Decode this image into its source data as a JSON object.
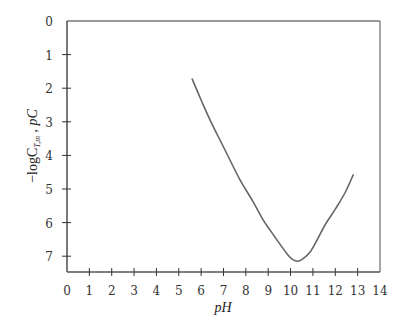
{
  "chart_data": {
    "type": "line",
    "title": "",
    "xlabel": "pH",
    "ylabel": "−logC_T,m , pC",
    "ylabel_parts": {
      "prefix": "−logC",
      "subscript": "T,m",
      "suffix": " ,  pC"
    },
    "xlim": [
      0,
      14
    ],
    "ylim": [
      0,
      7.5
    ],
    "y_inverted": true,
    "grid": false,
    "x_ticks": [
      "0",
      "1",
      "2",
      "3",
      "4",
      "5",
      "6",
      "7",
      "8",
      "9",
      "10",
      "11",
      "12",
      "13",
      "14"
    ],
    "y_ticks": [
      "0",
      "1",
      "2",
      "3",
      "4",
      "5",
      "6",
      "7"
    ],
    "series": [
      {
        "name": "log C_T,m vs pH",
        "color": "#666666",
        "x": [
          5.6,
          6.0,
          6.4,
          7.0,
          7.74,
          8.3,
          8.77,
          9.08,
          9.5,
          9.88,
          10.1,
          10.3,
          10.5,
          10.87,
          11.2,
          11.54,
          12.0,
          12.43,
          12.8
        ],
        "y": [
          1.73,
          2.35,
          2.95,
          3.75,
          4.73,
          5.35,
          5.92,
          6.22,
          6.62,
          6.96,
          7.1,
          7.15,
          7.1,
          6.88,
          6.5,
          6.07,
          5.6,
          5.12,
          4.58
        ]
      }
    ]
  }
}
